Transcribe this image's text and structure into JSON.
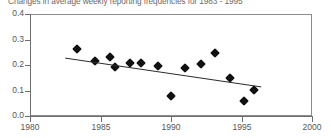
{
  "chart_data": {
    "type": "scatter",
    "title": "Changes in average weekly reporting frequencies for 1983 - 1995",
    "xlabel": "",
    "ylabel": "",
    "xlim": [
      1980,
      2000
    ],
    "ylim": [
      0.0,
      0.4
    ],
    "grid": false,
    "legend": "none",
    "xticks": [
      "1980",
      "1985",
      "1990",
      "1995",
      "2000"
    ],
    "xtick_values": [
      1980,
      1985,
      1990,
      1995,
      2000
    ],
    "yticks": [
      "0.0",
      "0.1",
      "0.2",
      "0.3",
      "0.4"
    ],
    "ytick_values": [
      0.0,
      0.1,
      0.2,
      0.3,
      0.4
    ],
    "marker": "diamond",
    "marker_color": "#111111",
    "points": [
      {
        "x": 1983.3,
        "y": 0.262
      },
      {
        "x": 1984.6,
        "y": 0.215
      },
      {
        "x": 1985.7,
        "y": 0.233
      },
      {
        "x": 1986.0,
        "y": 0.192
      },
      {
        "x": 1987.1,
        "y": 0.208
      },
      {
        "x": 1987.9,
        "y": 0.207
      },
      {
        "x": 1989.1,
        "y": 0.196
      },
      {
        "x": 1990.0,
        "y": 0.079
      },
      {
        "x": 1991.0,
        "y": 0.188
      },
      {
        "x": 1992.1,
        "y": 0.203
      },
      {
        "x": 1993.1,
        "y": 0.247
      },
      {
        "x": 1994.2,
        "y": 0.15
      },
      {
        "x": 1995.2,
        "y": 0.06
      },
      {
        "x": 1995.9,
        "y": 0.102
      }
    ],
    "trendline": {
      "type": "linear",
      "x_start": 1982.5,
      "y_start": 0.227,
      "x_end": 1996.4,
      "y_end": 0.114,
      "color": "#2b2b2b"
    }
  }
}
